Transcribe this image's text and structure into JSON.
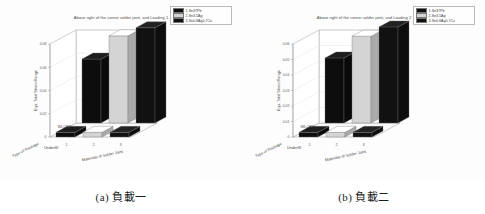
{
  "figure": {
    "background": "#ffffff",
    "panel_count": 2
  },
  "colors": {
    "series_1": "#0d0d0d",
    "series_2": "#d4d4d4",
    "series_3": "#111111",
    "axis_line": "#8a8a8a",
    "grid_line": "#d8d8d8",
    "floor": "#fbfbfb",
    "text": "#4a4a4a"
  },
  "panels": [
    {
      "id": "panel-a",
      "caption_prefix": "(a)",
      "caption_text": "負載一",
      "caption_full": "(a) 負載一",
      "chart_data": {
        "type": "bar",
        "subtype": "bar3-grouped-3d",
        "title": "Above right of the corner solder joint, and Loading 1",
        "xlabel": "Materials of Solder Joint",
        "zlabel": "Type of Package",
        "ylabel": "Equ. Total Strain Range",
        "categories": [
          "1",
          "2",
          "3"
        ],
        "row_categories": [
          "WLCSP",
          "Underfill"
        ],
        "ylim": [
          0,
          0.08
        ],
        "yticks": [
          "0",
          "0.02",
          "0.04",
          "0.06",
          "0.08"
        ],
        "ytick_values": [
          0,
          0.02,
          0.04,
          0.06,
          0.08
        ],
        "grid": true,
        "legend_position": "top-right",
        "legend": [
          {
            "key": "1",
            "label": "1-Sn37Pb",
            "color": "#0d0d0d"
          },
          {
            "key": "2",
            "label": "2-Sn3.5Ag",
            "color": "#d4d4d4"
          },
          {
            "key": "3",
            "label": "3-Sn0.8Ag0.7Cu",
            "color": "#111111"
          }
        ],
        "series": [
          {
            "name": "WLCSP",
            "values": [
              0.055,
              0.075,
              0.082
            ]
          },
          {
            "name": "Underfill",
            "values": [
              0.004,
              0.004,
              0.004
            ]
          }
        ]
      }
    },
    {
      "id": "panel-b",
      "caption_prefix": "(b)",
      "caption_text": "負載二",
      "caption_full": "(b) 負載二",
      "chart_data": {
        "type": "bar",
        "subtype": "bar3-grouped-3d",
        "title": "Above right of the corner solder joint, and Loading 2",
        "xlabel": "Materials of Solder Joint",
        "zlabel": "Type of Package",
        "ylabel": "Equ. Total Strain Range",
        "categories": [
          "1",
          "2",
          "3"
        ],
        "row_categories": [
          "WLCSP",
          "Underfill"
        ],
        "ylim": [
          0,
          0.06
        ],
        "yticks": [
          "0",
          "0.01",
          "0.02",
          "0.03",
          "0.04",
          "0.05",
          "0.06"
        ],
        "ytick_values": [
          0,
          0.01,
          0.02,
          0.03,
          0.04,
          0.05,
          0.06
        ],
        "grid": true,
        "legend_position": "top-right",
        "legend": [
          {
            "key": "1",
            "label": "1-Sn37Pb",
            "color": "#0d0d0d"
          },
          {
            "key": "2",
            "label": "2-Sn3.5Ag",
            "color": "#d4d4d4"
          },
          {
            "key": "3",
            "label": "3-Sn0.8Ag0.7Cu",
            "color": "#111111"
          }
        ],
        "series": [
          {
            "name": "WLCSP",
            "values": [
              0.042,
              0.056,
              0.062
            ]
          },
          {
            "name": "Underfill",
            "values": [
              0.003,
              0.003,
              0.003
            ]
          }
        ]
      }
    }
  ]
}
